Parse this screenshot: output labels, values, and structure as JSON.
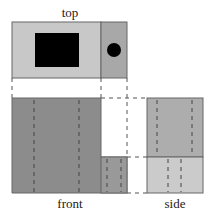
{
  "labels": {
    "top": "top",
    "front": "front",
    "side": "side"
  },
  "colors": {
    "top_left": "#c8c8c8",
    "top_right": "#a8a8a8",
    "front": "#8c8c8c",
    "front_lower": "#999999",
    "side_upper": "#adadad",
    "side_lower": "#cbcbcb",
    "black_block": "#000000",
    "border": "#666666"
  }
}
